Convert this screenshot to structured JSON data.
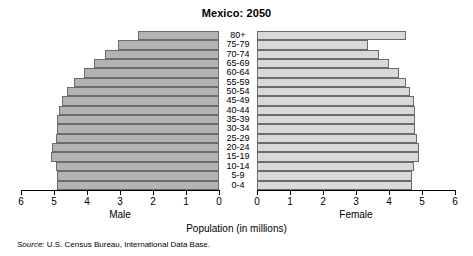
{
  "chart_data": {
    "type": "bar",
    "subtype": "population-pyramid",
    "title": "Mexico: 2050",
    "xlabel": "Population (in millions)",
    "ylabel": "",
    "grid": false,
    "legend_position": "none",
    "categories": [
      "80+",
      "75-79",
      "70-74",
      "65-69",
      "60-64",
      "55-59",
      "50-54",
      "45-49",
      "40-44",
      "35-39",
      "30-34",
      "25-29",
      "20-24",
      "15-19",
      "10-14",
      "5-9",
      "0-4"
    ],
    "series": [
      {
        "name": "Male",
        "direction": "left",
        "color": "#b3b3b3",
        "values": [
          2.45,
          3.05,
          3.45,
          3.8,
          4.1,
          4.4,
          4.6,
          4.75,
          4.85,
          4.9,
          4.9,
          4.95,
          5.05,
          5.1,
          4.95,
          4.9,
          4.9
        ]
      },
      {
        "name": "Female",
        "direction": "right",
        "color": "#d9d9d9",
        "values": [
          4.5,
          3.35,
          3.7,
          4.0,
          4.3,
          4.5,
          4.65,
          4.75,
          4.8,
          4.8,
          4.8,
          4.85,
          4.9,
          4.9,
          4.75,
          4.7,
          4.7
        ]
      }
    ],
    "xlim_male": [
      6,
      0
    ],
    "xlim_female": [
      0,
      6
    ],
    "xticks": [
      0,
      1,
      2,
      3,
      4,
      5,
      6
    ],
    "xticklabels_male": [
      "6",
      "5",
      "4",
      "3",
      "2",
      "1",
      "0"
    ],
    "xticklabels_female": [
      "0",
      "1",
      "2",
      "3",
      "4",
      "5",
      "6"
    ]
  },
  "axis_titles": {
    "male": "Male",
    "female": "Female"
  },
  "source": {
    "prefix": "Source:",
    "text": " U.S. Census Bureau, International Data Base."
  }
}
